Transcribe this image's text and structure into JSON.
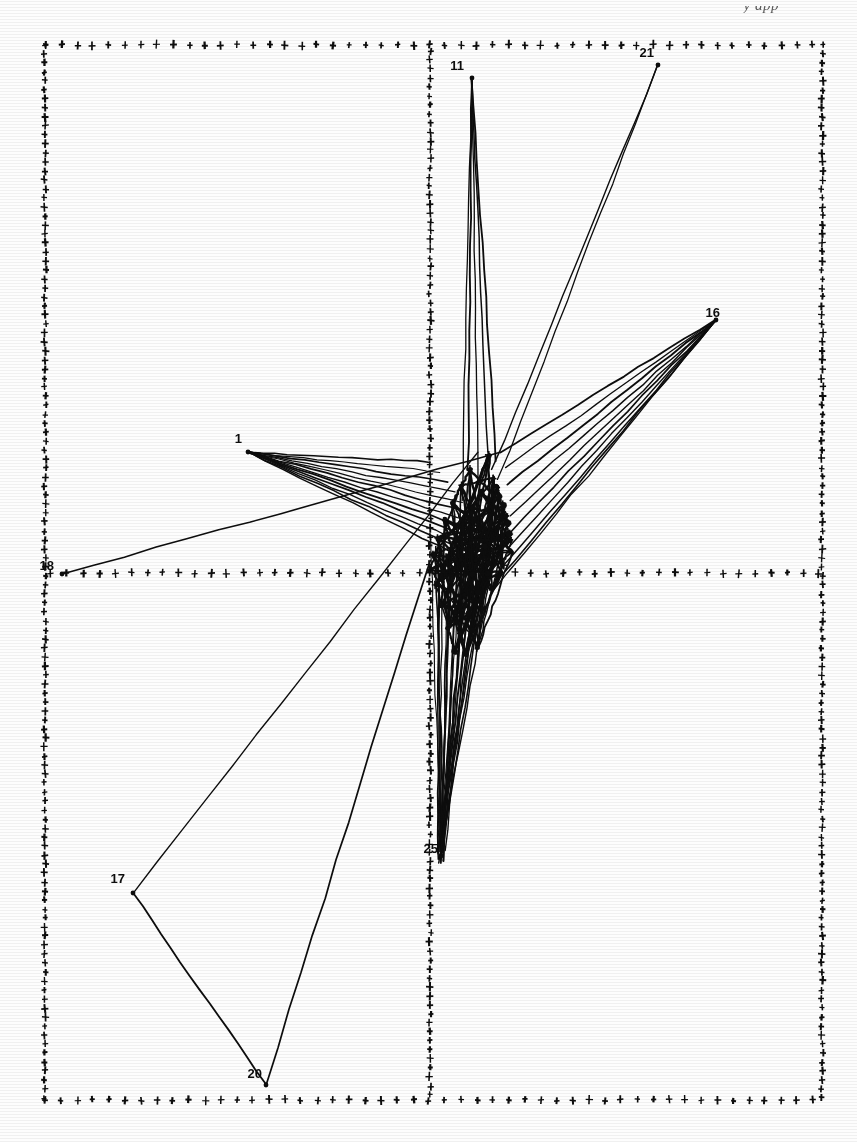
{
  "page": {
    "running_head": "y app",
    "background_color": "#fdfdfd",
    "ink_color": "#0d0d0d"
  },
  "figure": {
    "name": "graph-layout-plot",
    "frame": {
      "left": 45,
      "top": 45,
      "right": 822,
      "bottom": 1100
    },
    "axes": {
      "vertical_axis_x": 430,
      "horizontal_axis_y": 573,
      "marker_glyph": "+",
      "marker_spacing": 16
    }
  },
  "chart_data": {
    "type": "scatter",
    "title": "",
    "subtitle": "",
    "xlabel": "",
    "ylabel": "",
    "grid": false,
    "legend": null,
    "xlim": [
      45,
      822
    ],
    "ylim": [
      45,
      1100
    ],
    "labeled_nodes": [
      {
        "label": "11",
        "x": 472,
        "y": 78,
        "label_dx": -8,
        "label_dy": -8
      },
      {
        "label": "21",
        "x": 658,
        "y": 65,
        "label_dx": -4,
        "label_dy": -8
      },
      {
        "label": "16",
        "x": 716,
        "y": 320,
        "label_dx": 4,
        "label_dy": -3
      },
      {
        "label": "1",
        "x": 248,
        "y": 452,
        "label_dx": -6,
        "label_dy": -9
      },
      {
        "label": "18",
        "x": 62,
        "y": 574,
        "label_dx": -8,
        "label_dy": -4
      },
      {
        "label": "17",
        "x": 133,
        "y": 893,
        "label_dx": -8,
        "label_dy": -10
      },
      {
        "label": "20",
        "x": 266,
        "y": 1085,
        "label_dx": -4,
        "label_dy": -7
      },
      {
        "label": "25",
        "x": 441,
        "y": 856,
        "label_dx": -3,
        "label_dy": -3
      }
    ],
    "cluster_nodes": [
      {
        "x": 489,
        "y": 455
      },
      {
        "x": 470,
        "y": 470
      },
      {
        "x": 494,
        "y": 478
      },
      {
        "x": 461,
        "y": 486
      },
      {
        "x": 481,
        "y": 492
      },
      {
        "x": 500,
        "y": 497
      },
      {
        "x": 452,
        "y": 503
      },
      {
        "x": 472,
        "y": 508
      },
      {
        "x": 490,
        "y": 512
      },
      {
        "x": 506,
        "y": 516
      },
      {
        "x": 444,
        "y": 520
      },
      {
        "x": 463,
        "y": 524
      },
      {
        "x": 479,
        "y": 528
      },
      {
        "x": 495,
        "y": 531
      },
      {
        "x": 509,
        "y": 534
      },
      {
        "x": 438,
        "y": 538
      },
      {
        "x": 455,
        "y": 541
      },
      {
        "x": 470,
        "y": 544
      },
      {
        "x": 485,
        "y": 546
      },
      {
        "x": 499,
        "y": 549
      },
      {
        "x": 512,
        "y": 552
      },
      {
        "x": 433,
        "y": 555
      },
      {
        "x": 447,
        "y": 557
      },
      {
        "x": 461,
        "y": 559
      },
      {
        "x": 475,
        "y": 561
      },
      {
        "x": 489,
        "y": 563
      },
      {
        "x": 503,
        "y": 565
      },
      {
        "x": 430,
        "y": 570
      },
      {
        "x": 444,
        "y": 572
      },
      {
        "x": 458,
        "y": 574
      },
      {
        "x": 473,
        "y": 574
      },
      {
        "x": 487,
        "y": 573
      },
      {
        "x": 501,
        "y": 572
      },
      {
        "x": 436,
        "y": 585
      },
      {
        "x": 450,
        "y": 590
      },
      {
        "x": 464,
        "y": 594
      },
      {
        "x": 478,
        "y": 593
      },
      {
        "x": 492,
        "y": 589
      },
      {
        "x": 442,
        "y": 605
      },
      {
        "x": 456,
        "y": 612
      },
      {
        "x": 469,
        "y": 614
      },
      {
        "x": 482,
        "y": 609
      },
      {
        "x": 448,
        "y": 628
      },
      {
        "x": 460,
        "y": 634
      },
      {
        "x": 473,
        "y": 630
      },
      {
        "x": 455,
        "y": 651
      },
      {
        "x": 466,
        "y": 655
      },
      {
        "x": 478,
        "y": 648
      },
      {
        "x": 497,
        "y": 487
      },
      {
        "x": 503,
        "y": 505
      },
      {
        "x": 508,
        "y": 523
      },
      {
        "x": 511,
        "y": 541
      }
    ],
    "edge_bundles": [
      {
        "name": "fan-from-node-1",
        "from": [
          248,
          452
        ],
        "to_spread": [
          [
            430,
            462
          ],
          [
            440,
            472
          ],
          [
            448,
            482
          ],
          [
            455,
            492
          ],
          [
            462,
            502
          ],
          [
            468,
            512
          ],
          [
            473,
            522
          ],
          [
            478,
            532
          ],
          [
            482,
            542
          ],
          [
            486,
            552
          ],
          [
            489,
            562
          ],
          [
            492,
            572
          ]
        ]
      },
      {
        "name": "fan-from-node-16",
        "from": [
          716,
          320
        ],
        "to_spread": [
          [
            500,
            452
          ],
          [
            505,
            468
          ],
          [
            508,
            484
          ],
          [
            510,
            500
          ],
          [
            511,
            516
          ],
          [
            510,
            532
          ],
          [
            508,
            548
          ],
          [
            505,
            564
          ],
          [
            500,
            578
          ],
          [
            492,
            592
          ]
        ]
      },
      {
        "name": "fan-from-node-11",
        "from": [
          472,
          78
        ],
        "to_spread": [
          [
            468,
            470
          ],
          [
            478,
            480
          ],
          [
            488,
            452
          ],
          [
            496,
            462
          ],
          [
            462,
            500
          ]
        ]
      },
      {
        "name": "vertical-bundle-to-25",
        "from": [
          441,
          856
        ],
        "to_spread": [
          [
            438,
            560
          ],
          [
            448,
            560
          ],
          [
            458,
            560
          ],
          [
            468,
            560
          ],
          [
            478,
            560
          ],
          [
            488,
            560
          ]
        ]
      },
      {
        "name": "edge-21-cluster",
        "from": [
          658,
          65
        ],
        "to_spread": [
          [
            492,
            470
          ],
          [
            498,
            480
          ]
        ]
      },
      {
        "name": "edge-18-long",
        "from": [
          62,
          574
        ],
        "to_spread": [
          [
            500,
            452
          ]
        ]
      },
      {
        "name": "edge-17-20",
        "from": [
          133,
          893
        ],
        "to_spread": [
          [
            266,
            1085
          ]
        ]
      },
      {
        "name": "edge-17-up",
        "from": [
          133,
          893
        ],
        "to_spread": [
          [
            478,
            452
          ]
        ]
      },
      {
        "name": "edge-20-up",
        "from": [
          266,
          1085
        ],
        "to_spread": [
          [
            430,
            560
          ]
        ]
      }
    ]
  }
}
